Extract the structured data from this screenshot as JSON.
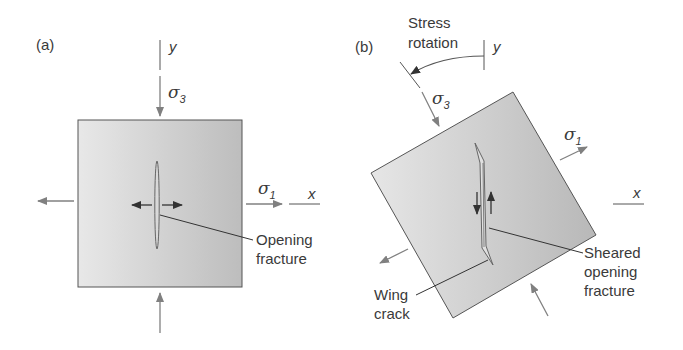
{
  "panel_a": {
    "label": "(a)",
    "axis_y": "y",
    "axis_x": "x",
    "sigma3": "σ",
    "sigma3_sub": "3",
    "sigma1": "σ",
    "sigma1_sub": "1",
    "fracture_label_line1": "Opening",
    "fracture_label_line2": "fracture"
  },
  "panel_b": {
    "label": "(b)",
    "rotation_line1": "Stress",
    "rotation_line2": "rotation",
    "axis_y": "y",
    "axis_x": "x",
    "sigma3": "σ",
    "sigma3_sub": "3",
    "sigma1": "σ",
    "sigma1_sub": "1",
    "wing_line1": "Wing",
    "wing_line2": "crack",
    "sheared_line1": "Sheared",
    "sheared_line2": "opening",
    "sheared_line3": "fracture"
  },
  "colors": {
    "stroke": "#555555",
    "arrow": "#808080",
    "block_light": "#e8e8e8",
    "block_dark": "#bcbcbc"
  }
}
